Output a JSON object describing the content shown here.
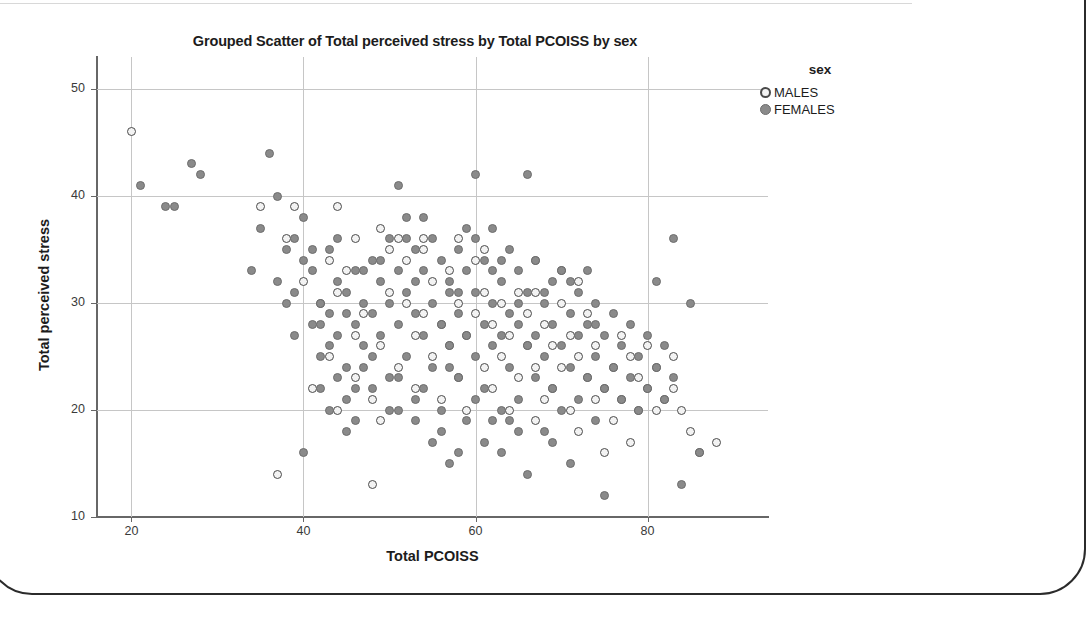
{
  "chart_data": {
    "type": "scatter",
    "title": "Grouped Scatter of Total perceived stress by Total PCOISS by sex",
    "xlabel": "Total PCOISS",
    "ylabel": "Total perceived stress",
    "xlim": [
      16,
      94
    ],
    "ylim": [
      10,
      53
    ],
    "xticks": [
      20,
      40,
      60,
      80
    ],
    "yticks": [
      10,
      20,
      30,
      40,
      50
    ],
    "grid": true,
    "legend": {
      "title": "sex",
      "position": "top-right",
      "entries": [
        {
          "label": "MALES",
          "marker": "open-circle",
          "color": "#f3f3f3",
          "edge": "#4a4a4a"
        },
        {
          "label": "FEMALES",
          "marker": "filled-circle",
          "color": "#8a8a8a",
          "edge": "#6e6e6e"
        }
      ]
    },
    "series": [
      {
        "name": "MALES",
        "marker": "open-circle",
        "points": [
          [
            20,
            46
          ],
          [
            35,
            39
          ],
          [
            37,
            14
          ],
          [
            38,
            36
          ],
          [
            39,
            39
          ],
          [
            41,
            22
          ],
          [
            42,
            30
          ],
          [
            43,
            25
          ],
          [
            44,
            31
          ],
          [
            44,
            20
          ],
          [
            45,
            33
          ],
          [
            46,
            27
          ],
          [
            46,
            23
          ],
          [
            47,
            29
          ],
          [
            48,
            13
          ],
          [
            48,
            21
          ],
          [
            49,
            26
          ],
          [
            49,
            19
          ],
          [
            50,
            35
          ],
          [
            50,
            31
          ],
          [
            51,
            24
          ],
          [
            52,
            34
          ],
          [
            52,
            30
          ],
          [
            53,
            27
          ],
          [
            53,
            22
          ],
          [
            54,
            35
          ],
          [
            54,
            29
          ],
          [
            55,
            32
          ],
          [
            55,
            25
          ],
          [
            56,
            28
          ],
          [
            56,
            21
          ],
          [
            57,
            33
          ],
          [
            57,
            26
          ],
          [
            58,
            30
          ],
          [
            58,
            23
          ],
          [
            59,
            27
          ],
          [
            59,
            20
          ],
          [
            60,
            34
          ],
          [
            60,
            29
          ],
          [
            61,
            31
          ],
          [
            61,
            24
          ],
          [
            62,
            28
          ],
          [
            62,
            22
          ],
          [
            63,
            30
          ],
          [
            63,
            25
          ],
          [
            64,
            27
          ],
          [
            64,
            20
          ],
          [
            65,
            31
          ],
          [
            65,
            23
          ],
          [
            66,
            29
          ],
          [
            66,
            26
          ],
          [
            67,
            24
          ],
          [
            67,
            19
          ],
          [
            68,
            28
          ],
          [
            68,
            21
          ],
          [
            69,
            26
          ],
          [
            69,
            22
          ],
          [
            70,
            30
          ],
          [
            70,
            24
          ],
          [
            71,
            27
          ],
          [
            71,
            20
          ],
          [
            72,
            25
          ],
          [
            72,
            18
          ],
          [
            73,
            23
          ],
          [
            73,
            29
          ],
          [
            74,
            26
          ],
          [
            74,
            21
          ],
          [
            75,
            22
          ],
          [
            75,
            16
          ],
          [
            76,
            24
          ],
          [
            76,
            19
          ],
          [
            77,
            27
          ],
          [
            77,
            21
          ],
          [
            78,
            25
          ],
          [
            78,
            17
          ],
          [
            79,
            23
          ],
          [
            79,
            20
          ],
          [
            80,
            26
          ],
          [
            80,
            22
          ],
          [
            81,
            24
          ],
          [
            81,
            20
          ],
          [
            82,
            21
          ],
          [
            83,
            25
          ],
          [
            83,
            22
          ],
          [
            84,
            20
          ],
          [
            85,
            18
          ],
          [
            86,
            16
          ],
          [
            88,
            17
          ],
          [
            44,
            39
          ],
          [
            40,
            32
          ],
          [
            43,
            34
          ],
          [
            46,
            36
          ],
          [
            51,
            36
          ],
          [
            54,
            36
          ],
          [
            67,
            31
          ],
          [
            70,
            33
          ],
          [
            72,
            32
          ],
          [
            61,
            35
          ],
          [
            58,
            36
          ],
          [
            49,
            37
          ]
        ]
      },
      {
        "name": "FEMALES",
        "marker": "filled-circle",
        "points": [
          [
            21,
            41
          ],
          [
            24,
            39
          ],
          [
            25,
            39
          ],
          [
            27,
            43
          ],
          [
            28,
            42
          ],
          [
            34,
            33
          ],
          [
            36,
            44
          ],
          [
            37,
            40
          ],
          [
            38,
            35
          ],
          [
            38,
            30
          ],
          [
            39,
            36
          ],
          [
            39,
            31
          ],
          [
            40,
            34
          ],
          [
            40,
            16
          ],
          [
            41,
            33
          ],
          [
            41,
            28
          ],
          [
            42,
            30
          ],
          [
            42,
            25
          ],
          [
            43,
            35
          ],
          [
            43,
            29
          ],
          [
            43,
            20
          ],
          [
            44,
            32
          ],
          [
            44,
            27
          ],
          [
            45,
            31
          ],
          [
            45,
            24
          ],
          [
            46,
            33
          ],
          [
            46,
            28
          ],
          [
            46,
            19
          ],
          [
            47,
            30
          ],
          [
            47,
            26
          ],
          [
            48,
            34
          ],
          [
            48,
            29
          ],
          [
            48,
            22
          ],
          [
            49,
            32
          ],
          [
            49,
            27
          ],
          [
            50,
            36
          ],
          [
            50,
            30
          ],
          [
            50,
            23
          ],
          [
            51,
            41
          ],
          [
            51,
            33
          ],
          [
            51,
            28
          ],
          [
            52,
            38
          ],
          [
            52,
            31
          ],
          [
            52,
            25
          ],
          [
            53,
            35
          ],
          [
            53,
            29
          ],
          [
            53,
            21
          ],
          [
            54,
            33
          ],
          [
            54,
            27
          ],
          [
            55,
            36
          ],
          [
            55,
            30
          ],
          [
            55,
            24
          ],
          [
            56,
            34
          ],
          [
            56,
            28
          ],
          [
            56,
            20
          ],
          [
            57,
            32
          ],
          [
            57,
            26
          ],
          [
            58,
            35
          ],
          [
            58,
            29
          ],
          [
            58,
            23
          ],
          [
            59,
            33
          ],
          [
            59,
            27
          ],
          [
            59,
            19
          ],
          [
            60,
            42
          ],
          [
            60,
            31
          ],
          [
            60,
            25
          ],
          [
            61,
            34
          ],
          [
            61,
            28
          ],
          [
            61,
            22
          ],
          [
            62,
            37
          ],
          [
            62,
            30
          ],
          [
            62,
            26
          ],
          [
            63,
            32
          ],
          [
            63,
            27
          ],
          [
            63,
            20
          ],
          [
            64,
            35
          ],
          [
            64,
            29
          ],
          [
            64,
            24
          ],
          [
            65,
            33
          ],
          [
            65,
            28
          ],
          [
            65,
            21
          ],
          [
            66,
            42
          ],
          [
            66,
            31
          ],
          [
            66,
            26
          ],
          [
            67,
            34
          ],
          [
            67,
            27
          ],
          [
            67,
            23
          ],
          [
            68,
            30
          ],
          [
            68,
            25
          ],
          [
            68,
            18
          ],
          [
            69,
            32
          ],
          [
            69,
            28
          ],
          [
            69,
            22
          ],
          [
            70,
            33
          ],
          [
            70,
            26
          ],
          [
            70,
            20
          ],
          [
            71,
            29
          ],
          [
            71,
            24
          ],
          [
            71,
            15
          ],
          [
            72,
            31
          ],
          [
            72,
            27
          ],
          [
            72,
            21
          ],
          [
            73,
            28
          ],
          [
            73,
            23
          ],
          [
            74,
            30
          ],
          [
            74,
            25
          ],
          [
            74,
            19
          ],
          [
            75,
            27
          ],
          [
            75,
            22
          ],
          [
            75,
            12
          ],
          [
            76,
            29
          ],
          [
            76,
            24
          ],
          [
            77,
            26
          ],
          [
            77,
            21
          ],
          [
            78,
            28
          ],
          [
            78,
            23
          ],
          [
            79,
            25
          ],
          [
            79,
            20
          ],
          [
            80,
            27
          ],
          [
            80,
            22
          ],
          [
            81,
            32
          ],
          [
            81,
            24
          ],
          [
            82,
            26
          ],
          [
            82,
            21
          ],
          [
            83,
            36
          ],
          [
            83,
            23
          ],
          [
            84,
            13
          ],
          [
            85,
            30
          ],
          [
            86,
            16
          ],
          [
            44,
            23
          ],
          [
            45,
            21
          ],
          [
            47,
            24
          ],
          [
            50,
            20
          ],
          [
            53,
            19
          ],
          [
            55,
            17
          ],
          [
            57,
            15
          ],
          [
            63,
            16
          ],
          [
            66,
            14
          ],
          [
            73,
            33
          ],
          [
            67,
            34
          ],
          [
            45,
            18
          ],
          [
            42,
            22
          ],
          [
            40,
            38
          ],
          [
            35,
            37
          ],
          [
            37,
            32
          ],
          [
            59,
            37
          ],
          [
            54,
            38
          ],
          [
            49,
            34
          ],
          [
            52,
            36
          ],
          [
            57,
            31
          ],
          [
            60,
            36
          ],
          [
            63,
            34
          ],
          [
            43,
            26
          ],
          [
            46,
            22
          ],
          [
            51,
            20
          ],
          [
            56,
            18
          ],
          [
            58,
            16
          ],
          [
            61,
            17
          ],
          [
            64,
            19
          ],
          [
            69,
            17
          ],
          [
            41,
            35
          ],
          [
            44,
            36
          ],
          [
            47,
            33
          ],
          [
            53,
            32
          ],
          [
            58,
            31
          ],
          [
            62,
            33
          ],
          [
            65,
            30
          ],
          [
            68,
            31
          ],
          [
            71,
            32
          ],
          [
            74,
            28
          ],
          [
            39,
            27
          ],
          [
            42,
            28
          ],
          [
            45,
            29
          ],
          [
            48,
            25
          ],
          [
            51,
            23
          ],
          [
            54,
            22
          ],
          [
            57,
            24
          ],
          [
            60,
            21
          ],
          [
            62,
            19
          ],
          [
            65,
            18
          ]
        ]
      }
    ]
  }
}
